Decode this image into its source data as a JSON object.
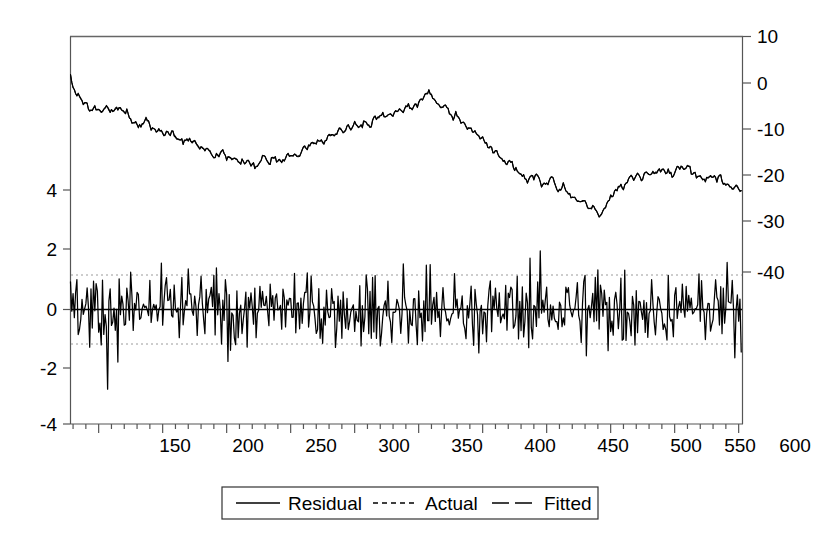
{
  "chart_data": {
    "type": "line",
    "title": "",
    "subtitle": "",
    "xlabel": "",
    "ylabel": "",
    "x": {
      "min": 78,
      "max": 603,
      "tick_labels": [
        "150",
        "200",
        "250",
        "300",
        "350",
        "400",
        "450",
        "500",
        "550",
        "600"
      ],
      "tick_values": [
        150,
        200,
        250,
        300,
        350,
        400,
        450,
        500,
        550,
        600
      ],
      "minor_tick_step": 10,
      "grid": false
    },
    "y_left": {
      "label": "",
      "tick_labels": [
        "4",
        "2",
        "0",
        "-2",
        "-4"
      ],
      "tick_values": [
        4,
        2,
        0,
        -2,
        -4
      ],
      "ylim": [
        -4,
        10.5
      ],
      "grid": false,
      "note": "Residual axis"
    },
    "y_right": {
      "label": "",
      "tick_labels": [
        "10",
        "0",
        "-10",
        "-20",
        "-30",
        "-40"
      ],
      "tick_values": [
        10,
        0,
        -10,
        -20,
        -30,
        -40
      ],
      "ylim": [
        -48,
        10
      ],
      "grid": false,
      "note": "Actual and Fitted axis"
    },
    "reference_lines": [
      {
        "name": "zero-line",
        "axis": "left",
        "value": 0,
        "style": "solid",
        "color": "#000000"
      },
      {
        "name": "upper-band",
        "axis": "left",
        "value": 1.18,
        "style": "dotted",
        "color": "#9a9a9a"
      },
      {
        "name": "lower-band",
        "axis": "left",
        "value": -1.2,
        "style": "dotted",
        "color": "#9a9a9a"
      }
    ],
    "legend": {
      "position": "bottom-center",
      "entries": [
        {
          "label": "Residual",
          "style": "solid",
          "color": "#000000"
        },
        {
          "label": "Actual",
          "style": "dashed",
          "color": "#000000"
        },
        {
          "label": "Fitted",
          "style": "long-dash",
          "color": "#000000"
        }
      ]
    },
    "series": [
      {
        "name": "Actual",
        "axis": "right",
        "style": "dashed",
        "color": "#000000",
        "sampled_values": [
          1.5,
          -1.0,
          -2.6,
          -1.9,
          -3.4,
          -4.2,
          -3.6,
          -4.9,
          -5.6,
          -4.8,
          -5.3,
          -6.4,
          -5.8,
          -4.9,
          -5.4,
          -6.1,
          -5.5,
          -4.6,
          -5.2,
          -6.0,
          -6.8,
          -6.2,
          -7.4,
          -8.2,
          -7.6,
          -8.5,
          -9.4,
          -8.8,
          -8.1,
          -8.9,
          -9.8,
          -9.2,
          -10.0,
          -9.3,
          -10.2,
          -11.0,
          -10.4,
          -11.3,
          -10.6,
          -11.4,
          -12.2,
          -11.5,
          -12.3,
          -11.6,
          -12.5,
          -13.3,
          -12.6,
          -13.4,
          -14.2,
          -13.5,
          -14.3,
          -13.6,
          -14.5,
          -15.3,
          -14.6,
          -15.4,
          -14.7,
          -15.5,
          -16.3,
          -15.6,
          -16.4,
          -15.7,
          -16.5,
          -17.3,
          -16.6,
          -17.4,
          -16.7,
          -17.5,
          -16.8,
          -17.6,
          -16.9,
          -16.2,
          -15.4,
          -16.2,
          -17.0,
          -16.3,
          -15.5,
          -16.3,
          -17.1,
          -16.4,
          -15.6,
          -14.8,
          -15.6,
          -14.9,
          -15.7,
          -14.9,
          -14.1,
          -13.3,
          -14.1,
          -13.4,
          -12.6,
          -13.4,
          -12.7,
          -11.9,
          -12.7,
          -11.9,
          -11.1,
          -10.3,
          -11.1,
          -10.4,
          -9.6,
          -10.4,
          -9.7,
          -8.9,
          -9.7,
          -8.9,
          -8.1,
          -8.9,
          -9.7,
          -9.0,
          -8.2,
          -9.0,
          -8.3,
          -7.5,
          -8.3,
          -7.5,
          -6.7,
          -7.5,
          -6.8,
          -6.0,
          -6.8,
          -6.0,
          -5.2,
          -6.0,
          -5.3,
          -4.5,
          -5.3,
          -4.5,
          -3.7,
          -4.5,
          -3.8,
          -3.0,
          -2.2,
          -1.4,
          -2.2,
          -3.0,
          -3.8,
          -4.6,
          -5.4,
          -4.7,
          -5.5,
          -6.3,
          -7.1,
          -6.4,
          -7.2,
          -8.0,
          -8.8,
          -9.6,
          -8.9,
          -9.7,
          -10.5,
          -11.3,
          -12.1,
          -11.4,
          -12.2,
          -13.0,
          -13.8,
          -14.6,
          -13.9,
          -14.7,
          -15.5,
          -16.3,
          -17.1,
          -16.4,
          -17.2,
          -18.0,
          -18.8,
          -19.6,
          -18.9,
          -19.7,
          -20.5,
          -19.8,
          -20.6,
          -19.9,
          -20.7,
          -21.5,
          -20.8,
          -21.6,
          -20.9,
          -20.1,
          -20.9,
          -21.7,
          -22.5,
          -21.8,
          -22.6,
          -23.4,
          -24.2,
          -23.5,
          -24.3,
          -25.1,
          -24.4,
          -25.2,
          -26.0,
          -26.8,
          -26.1,
          -26.9,
          -27.7,
          -27.0,
          -26.2,
          -25.4,
          -24.6,
          -23.8,
          -23.0,
          -22.2,
          -21.4,
          -22.2,
          -21.5,
          -20.7,
          -19.9,
          -20.7,
          -19.9,
          -19.1,
          -19.9,
          -19.2,
          -18.4,
          -19.2,
          -18.4,
          -19.2,
          -18.5,
          -19.3,
          -18.5,
          -19.3,
          -18.6,
          -19.4,
          -18.6,
          -17.8,
          -18.6,
          -17.9,
          -18.7,
          -17.9,
          -18.7,
          -19.5,
          -18.8,
          -19.6,
          -18.8,
          -19.6,
          -20.4,
          -19.7,
          -20.5,
          -19.7,
          -20.5,
          -19.8,
          -20.6,
          -21.4,
          -20.7,
          -21.5,
          -22.3,
          -21.6,
          -22.4,
          -23.2
        ]
      },
      {
        "name": "Fitted",
        "axis": "right",
        "style": "long-dash",
        "color": "#000000",
        "note": "Nearly coincident with Actual"
      },
      {
        "name": "Residual",
        "axis": "left",
        "style": "solid",
        "color": "#000000",
        "mean": 0,
        "approx_std": 1.2,
        "range": [
          -3.4,
          3.3
        ]
      }
    ]
  },
  "legend": {
    "residual": "Residual",
    "actual": "Actual",
    "fitted": "Fitted"
  },
  "axis": {
    "left_ticks": [
      "4",
      "2",
      "0",
      "-2",
      "-4"
    ],
    "right_ticks": [
      "10",
      "0",
      "-10",
      "-20",
      "-30",
      "-40"
    ],
    "bottom_ticks": [
      "150",
      "200",
      "250",
      "300",
      "350",
      "400",
      "450",
      "500",
      "550",
      "600"
    ]
  },
  "colors": {
    "line": "#000000",
    "frame": "#666666",
    "band": "#9a9a9a",
    "background": "#ffffff"
  }
}
